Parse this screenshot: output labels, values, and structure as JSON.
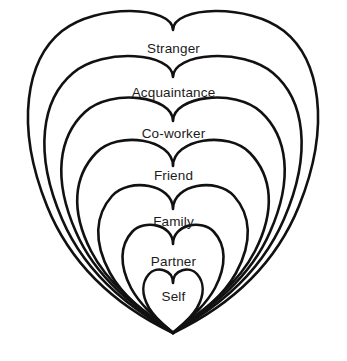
{
  "diagram": {
    "type": "nested-hearts-relationship-circles",
    "background_color": "#ffffff",
    "stroke_color": "#111111",
    "text_color": "#1b1b1b",
    "center_x": 173,
    "bottom_point_y": 333,
    "rings": [
      {
        "label": "Stranger",
        "order": 1,
        "level": "outermost",
        "label_x": 173,
        "label_y": 49,
        "top_y": 23,
        "left_x": 22,
        "right_x": 324,
        "half_width": 151,
        "lobe_depth": 3,
        "path": "M 173 30 C 173 6 97 3 62 31 C 27 59 14 124 47 206 C 80 288 150 322 173 333 C 196 322 266 288 299 206 C 332 124 319 59 284 31 C 249 3 173 6 173 30 Z"
      },
      {
        "label": "Acquaintance",
        "order": 2,
        "level": "second",
        "label_x": 173,
        "label_y": 93,
        "top_y": 68,
        "left_x": 40,
        "right_x": 306,
        "half_width": 133,
        "lobe_depth": 6,
        "path": "M 173 77 C 173 53 104 47 73 73 C 42 99 33 152 62 219 C 91 287 152 320 173 333 C 194 320 255 287 284 219 C 313 152 304 99 273 73 C 242 47 173 53 173 77 Z"
      },
      {
        "label": "Co-worker",
        "order": 3,
        "level": "third",
        "label_x": 173,
        "label_y": 134,
        "top_y": 108,
        "left_x": 58,
        "right_x": 288,
        "half_width": 115,
        "lobe_depth": 10,
        "path": "M 173 121 C 173 96 111 88 85 112 C 59 136 52 178 76 232 C 100 288 154 319 173 333 C 192 319 246 288 270 232 C 294 178 287 136 261 112 C 235 88 173 96 173 121 Z"
      },
      {
        "label": "Friend",
        "order": 4,
        "level": "fourth",
        "label_x": 173,
        "label_y": 176,
        "top_y": 147,
        "left_x": 77,
        "right_x": 269,
        "half_width": 96,
        "lobe_depth": 16,
        "path": "M 173 166 C 173 139 118 130 96 153 C 74 176 70 210 91 251 C 112 292 157 320 173 333 C 189 320 234 292 255 251 C 276 210 272 176 250 153 C 228 130 173 139 173 166 Z"
      },
      {
        "label": "Family",
        "order": 5,
        "level": "fifth",
        "label_x": 173,
        "label_y": 222,
        "top_y": 190,
        "left_x": 100,
        "right_x": 246,
        "half_width": 73,
        "lobe_depth": 19,
        "path": "M 173 209 C 173 184 129 177 112 196 C 95 215 93 242 110 273 C 127 304 161 323 173 333 C 185 323 219 304 236 273 C 253 242 251 215 234 196 C 217 177 173 184 173 209 Z"
      },
      {
        "label": "Partner",
        "order": 6,
        "level": "sixth",
        "label_x": 173,
        "label_y": 262,
        "top_y": 228,
        "left_x": 123,
        "right_x": 223,
        "half_width": 50,
        "lobe_depth": 16,
        "path": "M 173 244 C 173 224 144 219 132 232 C 120 245 119 265 131 288 C 143 310 165 325 173 333 C 181 325 203 310 215 288 C 227 265 226 245 214 232 C 202 219 173 224 173 244 Z"
      },
      {
        "label": "Self",
        "order": 7,
        "level": "innermost",
        "label_x": 173,
        "label_y": 297,
        "top_y": 270,
        "left_x": 144,
        "right_x": 202,
        "half_width": 29,
        "lobe_depth": 11,
        "path": "M 173 283 C 173 269 156 266 149 274 C 142 282 141 294 149 308 C 157 321 169 329 173 333 C 177 329 189 321 197 308 C 205 294 204 282 197 274 C 190 266 173 269 173 283 Z"
      }
    ]
  }
}
